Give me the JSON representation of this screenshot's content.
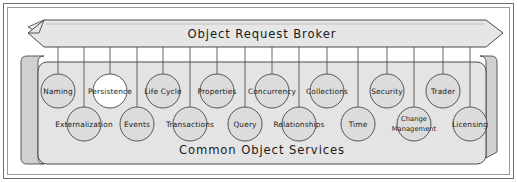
{
  "diagram": {
    "title": "Object Request Broker",
    "orb": {
      "label": "Object Request Broker",
      "shape": "chevron-bar-3d",
      "fill": "#e6e6e6",
      "stroke": "#4a4a4a"
    },
    "services_box": {
      "label": "Common Object Services",
      "shape": "rounded-box-3d",
      "fill": "#e4e4e4",
      "side_fill": "#d2d2d2",
      "stroke": "#4a4a4a"
    },
    "colors": {
      "page_background": "#ffffff",
      "frame_stroke": "#5a5a5a",
      "node_fill": "#dcdcdc",
      "node_fill_highlight": "#ffffff",
      "node_stroke": "#555555",
      "connector_stroke": "#555555",
      "text": "#1a1a1a"
    },
    "top_row": [
      {
        "id": "naming",
        "label": "Naming",
        "cx": 58,
        "cy": 91,
        "r": 17,
        "highlight": false
      },
      {
        "id": "persistence",
        "label": "Persistence",
        "cx": 110,
        "cy": 91,
        "r": 17,
        "highlight": true
      },
      {
        "id": "life-cycle",
        "label": "Life Cycle",
        "cx": 163,
        "cy": 91,
        "r": 17,
        "highlight": false
      },
      {
        "id": "properties",
        "label": "Properties",
        "cx": 217,
        "cy": 91,
        "r": 17,
        "highlight": false
      },
      {
        "id": "concurrency",
        "label": "Concurrency",
        "cx": 272,
        "cy": 91,
        "r": 17,
        "highlight": false
      },
      {
        "id": "collections",
        "label": "Collections",
        "cx": 327,
        "cy": 91,
        "r": 17,
        "highlight": false
      },
      {
        "id": "security",
        "label": "Security",
        "cx": 387,
        "cy": 91,
        "r": 17,
        "highlight": false
      },
      {
        "id": "trader",
        "label": "Trader",
        "cx": 443,
        "cy": 91,
        "r": 17,
        "highlight": false
      }
    ],
    "bottom_row": [
      {
        "id": "externalization",
        "label": "Externalization",
        "cx": 84,
        "cy": 124,
        "r": 17,
        "lines": 1
      },
      {
        "id": "events",
        "label": "Events",
        "cx": 137,
        "cy": 124,
        "r": 17,
        "lines": 1
      },
      {
        "id": "transactions",
        "label": "Transactions",
        "cx": 190,
        "cy": 124,
        "r": 17,
        "lines": 1
      },
      {
        "id": "query",
        "label": "Query",
        "cx": 245,
        "cy": 124,
        "r": 17,
        "lines": 1
      },
      {
        "id": "relationships",
        "label": "Relationships",
        "cx": 299,
        "cy": 124,
        "r": 17,
        "lines": 1
      },
      {
        "id": "time",
        "label": "Time",
        "cx": 358,
        "cy": 124,
        "r": 17,
        "lines": 1
      },
      {
        "id": "change-management",
        "label": "Change Management",
        "cx": 414,
        "cy": 124,
        "r": 17,
        "lines": 2,
        "line1": "Change",
        "line2": "Management"
      },
      {
        "id": "licensing",
        "label": "Licensing",
        "cx": 470,
        "cy": 124,
        "r": 17,
        "lines": 1
      }
    ]
  }
}
